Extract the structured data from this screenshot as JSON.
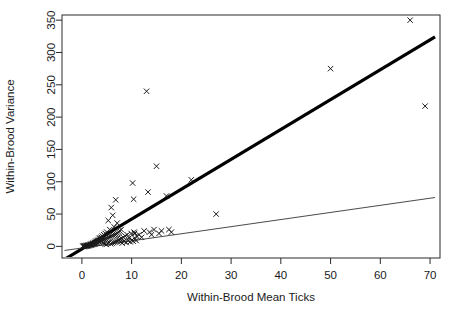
{
  "chart_data": {
    "type": "scatter",
    "title": "",
    "xlabel": "Within-Brood Mean Ticks",
    "ylabel": "Within-Brood Variance",
    "xlim": [
      -4,
      72
    ],
    "ylim": [
      -18,
      358
    ],
    "xticks": [
      0,
      10,
      20,
      30,
      40,
      50,
      60,
      70
    ],
    "yticks": [
      0,
      50,
      100,
      150,
      200,
      250,
      300,
      350
    ],
    "grid": false,
    "legend": "none",
    "marker": "x",
    "marker_color": "#1a1a1a",
    "points": [
      [
        0.2,
        0.1
      ],
      [
        0.3,
        0.2
      ],
      [
        0.4,
        0.3
      ],
      [
        0.5,
        0.4
      ],
      [
        0.6,
        0.3
      ],
      [
        0.7,
        0.6
      ],
      [
        0.8,
        0.5
      ],
      [
        0.9,
        1.0
      ],
      [
        1.0,
        0.8
      ],
      [
        1.1,
        1.4
      ],
      [
        1.2,
        1.0
      ],
      [
        1.3,
        2.0
      ],
      [
        1.4,
        1.2
      ],
      [
        1.5,
        2.4
      ],
      [
        1.6,
        1.6
      ],
      [
        1.7,
        3.0
      ],
      [
        1.8,
        2.0
      ],
      [
        1.9,
        3.6
      ],
      [
        2.0,
        2.5
      ],
      [
        2.1,
        4.4
      ],
      [
        2.2,
        3.0
      ],
      [
        2.3,
        5.0
      ],
      [
        2.4,
        3.5
      ],
      [
        2.5,
        6.0
      ],
      [
        2.6,
        4.0
      ],
      [
        2.7,
        7.0
      ],
      [
        2.8,
        4.5
      ],
      [
        2.9,
        8.0
      ],
      [
        3.0,
        5.0
      ],
      [
        3.1,
        9.0
      ],
      [
        3.2,
        6.0
      ],
      [
        3.3,
        10.0
      ],
      [
        3.4,
        7.0
      ],
      [
        3.5,
        12.0
      ],
      [
        3.6,
        7.5
      ],
      [
        3.7,
        13.0
      ],
      [
        3.8,
        8.0
      ],
      [
        3.9,
        14.0
      ],
      [
        4.0,
        9.0
      ],
      [
        4.1,
        16.0
      ],
      [
        4.2,
        10.0
      ],
      [
        4.3,
        5.0
      ],
      [
        4.4,
        18.0
      ],
      [
        4.5,
        11.0
      ],
      [
        4.6,
        4.0
      ],
      [
        4.7,
        20.0
      ],
      [
        4.8,
        12.0
      ],
      [
        4.9,
        3.0
      ],
      [
        5.0,
        22.0
      ],
      [
        5.1,
        13.0
      ],
      [
        5.2,
        5.0
      ],
      [
        5.3,
        40.0
      ],
      [
        5.4,
        14.0
      ],
      [
        5.5,
        6.0
      ],
      [
        5.6,
        26.0
      ],
      [
        5.7,
        15.0
      ],
      [
        5.8,
        4.0
      ],
      [
        5.9,
        60.0
      ],
      [
        6.0,
        16.0
      ],
      [
        6.1,
        5.0
      ],
      [
        6.2,
        48.0
      ],
      [
        6.3,
        17.0
      ],
      [
        6.4,
        6.0
      ],
      [
        6.5,
        30.0
      ],
      [
        6.6,
        18.0
      ],
      [
        6.7,
        7.0
      ],
      [
        6.8,
        72.0
      ],
      [
        6.9,
        19.0
      ],
      [
        7.0,
        8.0
      ],
      [
        7.1,
        36.0
      ],
      [
        7.2,
        20.0
      ],
      [
        7.3,
        9.0
      ],
      [
        7.4,
        22.0
      ],
      [
        7.5,
        10.0
      ],
      [
        7.6,
        24.0
      ],
      [
        7.7,
        11.0
      ],
      [
        7.8,
        7.0
      ],
      [
        7.9,
        26.0
      ],
      [
        8.0,
        12.0
      ],
      [
        8.1,
        5.0
      ],
      [
        8.3,
        14.0
      ],
      [
        8.5,
        8.0
      ],
      [
        8.7,
        16.0
      ],
      [
        8.9,
        6.0
      ],
      [
        9.1,
        18.0
      ],
      [
        9.3,
        9.0
      ],
      [
        9.5,
        13.0
      ],
      [
        9.7,
        7.0
      ],
      [
        9.9,
        20.0
      ],
      [
        10.1,
        10.0
      ],
      [
        10.3,
        8.0
      ],
      [
        10.5,
        22.0
      ],
      [
        10.7,
        12.0
      ],
      [
        10.9,
        9.0
      ],
      [
        10.2,
        98.0
      ],
      [
        10.4,
        73.0
      ],
      [
        10.6,
        20.0
      ],
      [
        11.0,
        16.0
      ],
      [
        11.5,
        18.0
      ],
      [
        12.0,
        14.0
      ],
      [
        12.5,
        24.0
      ],
      [
        13.0,
        240.0
      ],
      [
        13.3,
        84.0
      ],
      [
        13.6,
        22.0
      ],
      [
        14.0,
        18.0
      ],
      [
        14.5,
        26.0
      ],
      [
        15.0,
        124.0
      ],
      [
        15.5,
        20.0
      ],
      [
        16.0,
        24.0
      ],
      [
        17.0,
        78.0
      ],
      [
        17.5,
        26.0
      ],
      [
        18.0,
        22.0
      ],
      [
        22.0,
        103.0
      ],
      [
        27.0,
        50.0
      ],
      [
        50.0,
        275.0
      ],
      [
        66.0,
        350.0
      ],
      [
        69.0,
        217.0
      ]
    ],
    "lines": [
      {
        "name": "upper-fit-line",
        "style": "thick",
        "color": "#000000",
        "slope": 4.62,
        "intercept": -4.0,
        "x_start": -3.5,
        "x_end": 71.0
      },
      {
        "name": "lower-fit-line",
        "style": "thin",
        "color": "#4a4a4a",
        "slope": 1.1,
        "intercept": -2.5,
        "x_start": -3.5,
        "x_end": 71.0
      }
    ]
  }
}
